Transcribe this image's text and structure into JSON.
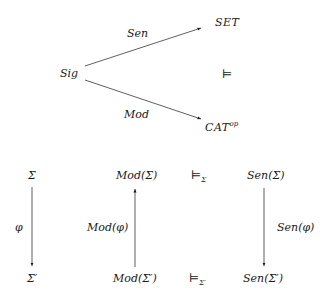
{
  "top_diagram": {
    "source": "Sig",
    "target_upper": "SET",
    "target_lower": "CAT",
    "target_lower_sup": "op",
    "arrow_upper_label": "Sen",
    "arrow_lower_label": "Mod",
    "relation_symbol": "⊨"
  },
  "bottom_diagram": {
    "col1": {
      "top": "Σ",
      "bottom": "Σ′",
      "arrow_label": "φ",
      "arrow_dir": "down"
    },
    "col2": {
      "top": "Mod(Σ)",
      "bottom": "Mod(Σ′)",
      "arrow_label": "Mod(φ)",
      "arrow_dir": "up"
    },
    "col3": {
      "top_symbol": "⊨",
      "top_sub": "Σ",
      "bottom_symbol": "⊨",
      "bottom_sub": "Σ′"
    },
    "col4": {
      "top": "Sen(Σ)",
      "bottom": "Sen(Σ′)",
      "arrow_label": "Sen(φ)",
      "arrow_dir": "down"
    }
  }
}
